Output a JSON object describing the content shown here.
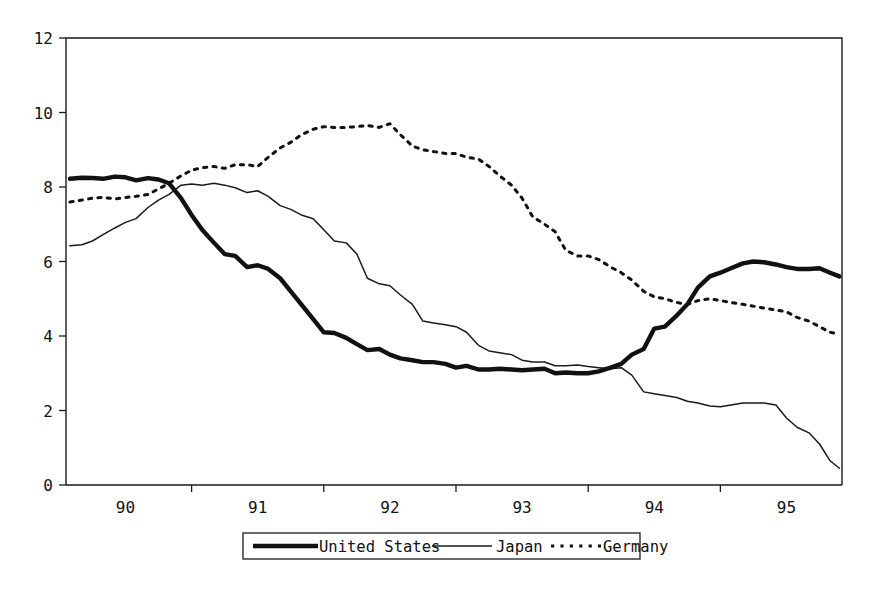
{
  "chart_data": {
    "type": "line",
    "title": "",
    "subtitle": "",
    "xlabel": "",
    "ylabel": "",
    "xlim": [
      89.55,
      95.42
    ],
    "ylim": [
      0,
      12
    ],
    "grid": false,
    "legend_position": "bottom-center",
    "y_ticks": [
      0,
      2,
      4,
      6,
      8,
      10,
      12
    ],
    "y_tick_labels": [
      "0",
      "2",
      "4",
      "6",
      "8",
      "10",
      "12"
    ],
    "x_ticks": [
      90,
      91,
      92,
      93,
      94,
      95
    ],
    "x_tick_labels": [
      "90",
      "91",
      "92",
      "93",
      "94",
      "95"
    ],
    "x_label_positions": [
      90.0,
      91.0,
      92.0,
      93.0,
      94.0,
      95.0
    ],
    "x": [
      89.58,
      89.67,
      89.75,
      89.83,
      89.92,
      90.0,
      90.08,
      90.17,
      90.25,
      90.33,
      90.42,
      90.5,
      90.58,
      90.67,
      90.75,
      90.83,
      90.92,
      91.0,
      91.08,
      91.17,
      91.25,
      91.33,
      91.42,
      91.5,
      91.58,
      91.67,
      91.75,
      91.83,
      91.92,
      92.0,
      92.08,
      92.17,
      92.25,
      92.33,
      92.42,
      92.5,
      92.58,
      92.67,
      92.75,
      92.83,
      92.92,
      93.0,
      93.08,
      93.17,
      93.25,
      93.33,
      93.42,
      93.5,
      93.58,
      93.67,
      93.75,
      93.83,
      93.92,
      94.0,
      94.08,
      94.17,
      94.25,
      94.33,
      94.42,
      94.5,
      94.58,
      94.67,
      94.75,
      94.83,
      94.92,
      95.0,
      95.08,
      95.17,
      95.25,
      95.33,
      95.4
    ],
    "series": [
      {
        "name": "United States",
        "style": "thick-solid",
        "color": "#111111",
        "values": [
          8.22,
          8.25,
          8.24,
          8.22,
          8.28,
          8.26,
          8.18,
          8.24,
          8.2,
          8.1,
          7.7,
          7.25,
          6.85,
          6.5,
          6.2,
          6.15,
          5.85,
          5.9,
          5.8,
          5.55,
          5.2,
          4.85,
          4.45,
          4.1,
          4.08,
          3.95,
          3.78,
          3.62,
          3.65,
          3.5,
          3.4,
          3.35,
          3.3,
          3.3,
          3.25,
          3.15,
          3.2,
          3.1,
          3.1,
          3.12,
          3.1,
          3.08,
          3.1,
          3.12,
          3.0,
          3.02,
          3.0,
          3.0,
          3.05,
          3.15,
          3.25,
          3.5,
          3.65,
          4.2,
          4.25,
          4.55,
          4.85,
          5.3,
          5.6,
          5.7,
          5.82,
          5.95,
          6.0,
          5.98,
          5.92,
          5.85,
          5.8,
          5.8,
          5.82,
          5.7,
          5.6
        ]
      },
      {
        "name": "Japan",
        "style": "thin-solid",
        "color": "#1a1a1a",
        "values": [
          6.42,
          6.45,
          6.55,
          6.72,
          6.9,
          7.05,
          7.15,
          7.45,
          7.65,
          7.8,
          8.05,
          8.08,
          8.05,
          8.1,
          8.05,
          7.98,
          7.85,
          7.9,
          7.75,
          7.5,
          7.4,
          7.25,
          7.15,
          6.85,
          6.55,
          6.5,
          6.2,
          5.55,
          5.4,
          5.35,
          5.1,
          4.85,
          4.4,
          4.35,
          4.3,
          4.25,
          4.1,
          3.75,
          3.6,
          3.55,
          3.5,
          3.35,
          3.3,
          3.3,
          3.2,
          3.2,
          3.22,
          3.18,
          3.15,
          3.12,
          3.15,
          2.95,
          2.5,
          2.45,
          2.4,
          2.35,
          2.25,
          2.2,
          2.12,
          2.1,
          2.15,
          2.2,
          2.2,
          2.2,
          2.15,
          1.8,
          1.55,
          1.4,
          1.1,
          0.65,
          0.45
        ]
      },
      {
        "name": "Germany",
        "style": "dotted",
        "color": "#111111",
        "values": [
          7.6,
          7.65,
          7.7,
          7.72,
          7.68,
          7.72,
          7.75,
          7.8,
          7.95,
          8.1,
          8.3,
          8.45,
          8.52,
          8.55,
          8.5,
          8.6,
          8.6,
          8.55,
          8.8,
          9.05,
          9.2,
          9.4,
          9.55,
          9.62,
          9.6,
          9.6,
          9.62,
          9.65,
          9.6,
          9.7,
          9.4,
          9.1,
          9.0,
          8.95,
          8.9,
          8.9,
          8.8,
          8.75,
          8.55,
          8.3,
          8.05,
          7.7,
          7.2,
          7.0,
          6.8,
          6.3,
          6.15,
          6.15,
          6.05,
          5.85,
          5.7,
          5.5,
          5.2,
          5.05,
          5.0,
          4.9,
          4.85,
          4.95,
          5.0,
          4.95,
          4.9,
          4.85,
          4.8,
          4.75,
          4.7,
          4.65,
          4.5,
          4.4,
          4.25,
          4.1,
          4.05
        ]
      }
    ]
  },
  "legend": {
    "items": [
      {
        "label": "United States",
        "style": "thick-solid"
      },
      {
        "label": "Japan",
        "style": "thin-solid"
      },
      {
        "label": "Germany",
        "style": "dotted"
      }
    ]
  }
}
